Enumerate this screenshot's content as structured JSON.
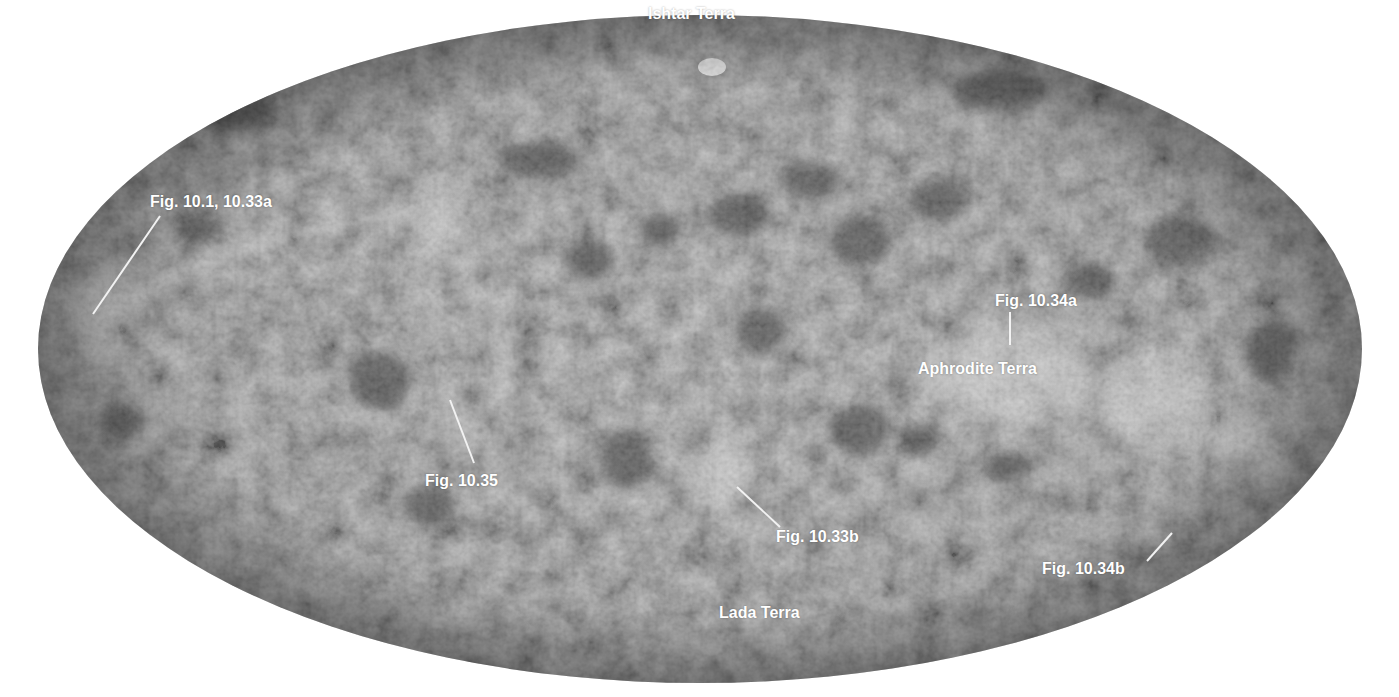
{
  "map": {
    "title": "Venus surface map (Mollweide projection)",
    "colors": {
      "background": "#ffffff",
      "surface_base": "#7f7f7f",
      "surface_dark": "#3c3c3c",
      "surface_light": "#d8d8d8",
      "label_text": "#ffffff",
      "leader_line": "#f2f2f2"
    },
    "labels": [
      {
        "id": "ishtar-terra",
        "text": "Ishtar Terra",
        "x": 648,
        "y": 5
      },
      {
        "id": "fig-10-1-10-33a",
        "text": "Fig. 10.1, 10.33a",
        "x": 150,
        "y": 193
      },
      {
        "id": "fig-10-34a",
        "text": "Fig. 10.34a",
        "x": 995,
        "y": 292
      },
      {
        "id": "aphrodite-terra",
        "text": "Aphrodite Terra",
        "x": 918,
        "y": 360
      },
      {
        "id": "fig-10-35",
        "text": "Fig. 10.35",
        "x": 425,
        "y": 472
      },
      {
        "id": "fig-10-33b",
        "text": "Fig. 10.33b",
        "x": 776,
        "y": 528
      },
      {
        "id": "fig-10-34b",
        "text": "Fig. 10.34b",
        "x": 1042,
        "y": 560
      },
      {
        "id": "lada-terra",
        "text": "Lada Terra",
        "x": 719,
        "y": 604
      }
    ],
    "leader_lines": [
      {
        "for": "fig-10-1-10-33a",
        "x1": 160,
        "y1": 216,
        "x2": 93,
        "y2": 314
      },
      {
        "for": "fig-10-34a",
        "x1": 1010,
        "y1": 312,
        "x2": 1010,
        "y2": 345
      },
      {
        "for": "fig-10-35",
        "x1": 450,
        "y1": 400,
        "x2": 474,
        "y2": 463
      },
      {
        "for": "fig-10-33b",
        "x1": 737,
        "y1": 487,
        "x2": 780,
        "y2": 527
      },
      {
        "for": "fig-10-34b",
        "x1": 1172,
        "y1": 533,
        "x2": 1147,
        "y2": 561
      }
    ]
  }
}
